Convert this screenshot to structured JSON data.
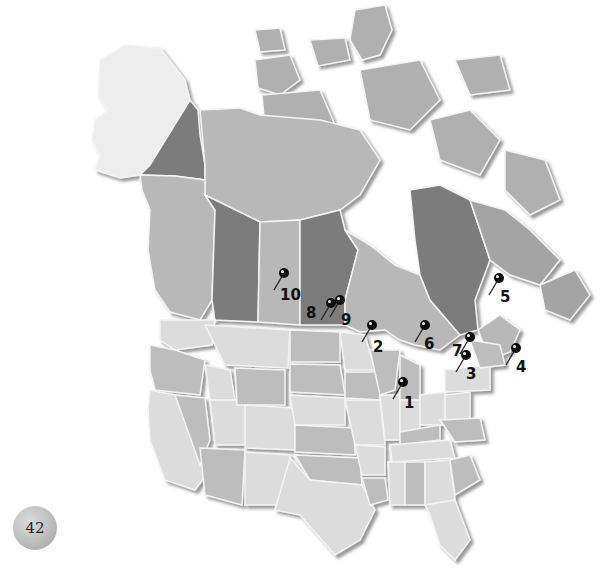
{
  "map": {
    "title": "North America — numbered location pins",
    "colors": {
      "background": "#ffffff",
      "alaska": "#ededed",
      "canada_light": "#b8b8b8",
      "canada_mid": "#a4a4a4",
      "canada_dark": "#7c7c7c",
      "usa_light": "#dcdcdc",
      "usa_mid": "#bdbdbd",
      "border": "#f4f4f4",
      "pin": "#0a0a0a"
    },
    "pins": [
      {
        "id": "1",
        "label": "1",
        "head_x": 403,
        "head_y": 382,
        "label_x": 404,
        "label_y": 408
      },
      {
        "id": "2",
        "label": "2",
        "head_x": 372,
        "head_y": 325,
        "label_x": 373,
        "label_y": 352
      },
      {
        "id": "3",
        "label": "3",
        "head_x": 466,
        "head_y": 355,
        "label_x": 466,
        "label_y": 379
      },
      {
        "id": "4",
        "label": "4",
        "head_x": 516,
        "head_y": 348,
        "label_x": 516,
        "label_y": 372
      },
      {
        "id": "5",
        "label": "5",
        "head_x": 499,
        "head_y": 278,
        "label_x": 500,
        "label_y": 302
      },
      {
        "id": "6",
        "label": "6",
        "head_x": 425,
        "head_y": 325,
        "label_x": 424,
        "label_y": 349
      },
      {
        "id": "7",
        "label": "7",
        "head_x": 470,
        "head_y": 337,
        "label_x": 452,
        "label_y": 356
      },
      {
        "id": "8",
        "label": "8",
        "head_x": 331,
        "head_y": 303,
        "label_x": 306,
        "label_y": 318
      },
      {
        "id": "9",
        "label": "9",
        "head_x": 340,
        "head_y": 300,
        "label_x": 341,
        "label_y": 325
      },
      {
        "id": "10",
        "label": "10",
        "head_x": 284,
        "head_y": 273,
        "label_x": 280,
        "label_y": 300
      }
    ]
  },
  "page": {
    "number": "42"
  }
}
